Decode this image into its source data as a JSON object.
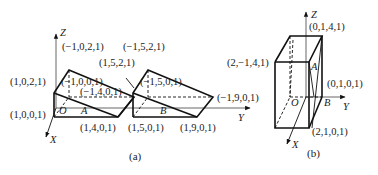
{
  "figure_a": {
    "caption": "(a)",
    "axes": {
      "x": "X",
      "y": "Y",
      "z": "Z",
      "origin": "O"
    },
    "regions": {
      "a": "A",
      "b": "B"
    },
    "labels": {
      "p_m1_0_2": "(−1,0,2,1)",
      "p_m1_5_2": "(−1,5,2,1)",
      "p_1_5_2": "(1,5,2,1)",
      "p_1_0_2": "(1,0,2,1)",
      "p_m1_0_0": "(−1,0,0,1)",
      "p_m1_5_0": "(−1,5,0,1)",
      "p_m1_4_0": "(−1,4,0,1)",
      "p_m1_9_0": "(−1,9,0,1)",
      "p_1_0_0": "(1,0,0,1)",
      "p_1_4_0": "(1,4,0,1)",
      "p_1_5_0": "(1,5,0,1)",
      "p_1_9_0": "(1,9,0,1)"
    }
  },
  "figure_b": {
    "caption": "(b)",
    "axes": {
      "x": "X",
      "y": "Y",
      "z": "Z",
      "origin": "O"
    },
    "regions": {
      "a": "A",
      "b": "B"
    },
    "labels": {
      "p_0_1_4": "(0,1,4,1)",
      "p_2_m1_4": "(2,−1,4,1)",
      "p_0_1_0": "(0,1,0,1)",
      "p_2_1_0": "(2,1,0,1)"
    }
  }
}
